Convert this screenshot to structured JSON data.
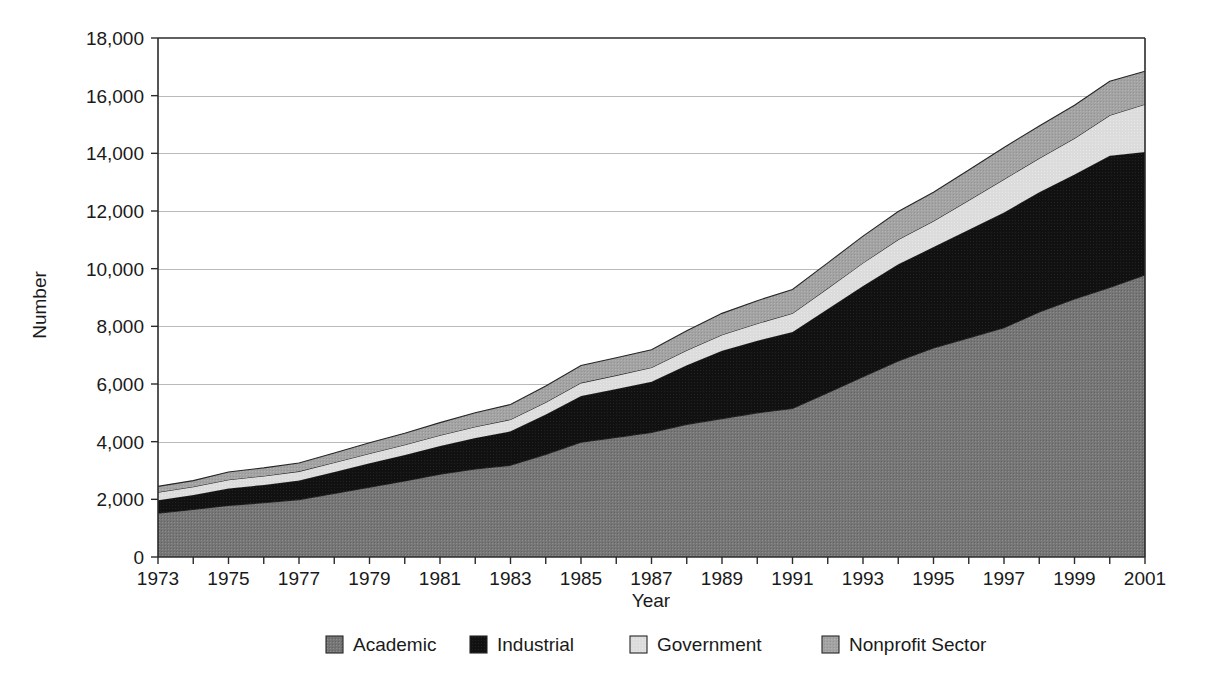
{
  "chart_data": {
    "type": "area",
    "title": "",
    "subtitle": "",
    "xlabel": "Year",
    "ylabel": "Number",
    "stacked": true,
    "grid": true,
    "legend_position": "bottom",
    "xlim": [
      1973,
      2001
    ],
    "ylim": [
      0,
      18000
    ],
    "ytick_step": 2000,
    "ytick_labels": [
      "18,000",
      "16,000",
      "14,000",
      "12,000",
      "10,000",
      "8,000",
      "6,000",
      "4,000",
      "2,000",
      "0"
    ],
    "ytick_values": [
      18000,
      16000,
      14000,
      12000,
      10000,
      8000,
      6000,
      4000,
      2000,
      0
    ],
    "xtick_labels": [
      "1973",
      "1975",
      "1977",
      "1979",
      "1981",
      "1983",
      "1985",
      "1987",
      "1989",
      "1991",
      "1993",
      "1995",
      "1997",
      "1999",
      "2001"
    ],
    "xtick_values": [
      1973,
      1975,
      1977,
      1979,
      1981,
      1983,
      1985,
      1987,
      1989,
      1991,
      1993,
      1995,
      1997,
      1999,
      2001
    ],
    "x": [
      1973,
      1974,
      1975,
      1976,
      1977,
      1978,
      1979,
      1980,
      1981,
      1982,
      1983,
      1984,
      1985,
      1986,
      1987,
      1988,
      1989,
      1990,
      1991,
      1992,
      1993,
      1994,
      1995,
      1996,
      1997,
      1998,
      1999,
      2000,
      2001
    ],
    "series": [
      {
        "name": "Academic",
        "color": "#767676",
        "values": [
          1520,
          1650,
          1790,
          1880,
          1990,
          2200,
          2420,
          2640,
          2870,
          3050,
          3180,
          3560,
          3980,
          4150,
          4320,
          4600,
          4800,
          5000,
          5150,
          5700,
          6250,
          6800,
          7250,
          7600,
          7950,
          8500,
          8950,
          9350,
          9780
        ]
      },
      {
        "name": "Industrial",
        "color": "#111111",
        "values": [
          450,
          500,
          590,
          620,
          660,
          750,
          830,
          900,
          980,
          1080,
          1180,
          1380,
          1600,
          1680,
          1760,
          2050,
          2350,
          2500,
          2650,
          2900,
          3150,
          3350,
          3500,
          3750,
          4000,
          4150,
          4320,
          4570,
          4270
        ]
      },
      {
        "name": "Government",
        "color": "#dcdcdc",
        "values": [
          280,
          290,
          300,
          310,
          320,
          330,
          340,
          355,
          370,
          390,
          410,
          430,
          460,
          470,
          490,
          520,
          560,
          600,
          650,
          720,
          800,
          860,
          900,
          1020,
          1150,
          1180,
          1250,
          1400,
          1650
        ]
      },
      {
        "name": "Nonprofit Sector",
        "color": "#a3a3a3",
        "values": [
          200,
          210,
          270,
          280,
          290,
          330,
          370,
          400,
          440,
          480,
          520,
          560,
          600,
          610,
          620,
          680,
          740,
          790,
          830,
          880,
          930,
          970,
          1000,
          1050,
          1100,
          1120,
          1150,
          1180,
          1150
        ]
      }
    ],
    "totals": [
      2450,
      2650,
      2950,
      3090,
      3260,
      3610,
      3960,
      4295,
      4660,
      5000,
      5290,
      5930,
      6640,
      6910,
      7190,
      7850,
      8450,
      8890,
      9280,
      10200,
      11130,
      11980,
      12650,
      13420,
      14200,
      14950,
      15670,
      16500,
      16850
    ]
  },
  "legend": {
    "items": [
      {
        "label": "Academic",
        "color": "#767676"
      },
      {
        "label": "Industrial",
        "color": "#111111"
      },
      {
        "label": "Government",
        "color": "#dcdcdc"
      },
      {
        "label": "Nonprofit Sector",
        "color": "#a3a3a3"
      }
    ]
  },
  "colors": {
    "axis": "#2b2b2b",
    "grid": "#b9b9b9",
    "text": "#1a1a1a",
    "outline": "#262626",
    "background": "#ffffff"
  }
}
